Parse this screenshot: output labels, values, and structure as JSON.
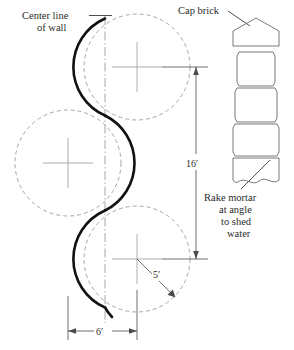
{
  "diagram": {
    "annotations": {
      "center_line": {
        "line1": "Center line",
        "line2": "of wall"
      },
      "cap_brick": {
        "line1": "Cap brick"
      },
      "rake_mortar": {
        "line1": "Rake mortar",
        "line2": "at angle",
        "line3": "to shed",
        "line4": "water"
      }
    },
    "dimensions": {
      "height": "16′",
      "radius": "5′",
      "width": "6′"
    },
    "colors": {
      "wall_curve": "#111111",
      "construction": "#8a8a8a",
      "dimension": "#4a4a4a",
      "text": "#2b2b2b",
      "background": "#ffffff"
    },
    "geometry": {
      "circle_radius_px": 53,
      "circle_top": {
        "cx": 137,
        "cy": 67
      },
      "circle_middle_left": {
        "cx": 68,
        "cy": 163
      },
      "circle_bottom": {
        "cx": 137,
        "cy": 259
      },
      "center_line_x": 105
    },
    "cap_brick_detail": {
      "courses": 5,
      "cap_shape": "pentagon"
    }
  }
}
